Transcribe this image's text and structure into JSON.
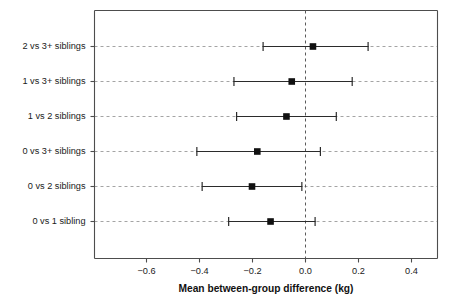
{
  "chart_data": {
    "type": "scatter",
    "subtype": "forest-plot",
    "title": "",
    "xlabel": "Mean between-group difference (kg)",
    "ylabel": "",
    "xlim": [
      -0.78,
      0.5
    ],
    "xticks": [
      -0.6,
      -0.4,
      -0.2,
      0.0,
      0.2,
      0.4
    ],
    "xticklabels": [
      "−0.6",
      "−0.4",
      "−0.2",
      "0.0",
      "0.2",
      "0.4"
    ],
    "grid": "horizontal-dashed",
    "reference_line": 0.0,
    "legend": "none",
    "categories": [
      "2 vs 3+ siblings",
      "1 vs 3+ siblings",
      "1 vs 2 siblings",
      "0 vs 3+ siblings",
      "0 vs 2 siblings",
      "0 vs 1 sibling"
    ],
    "points": [
      {
        "label": "2 vs 3+ siblings",
        "estimate": 0.03,
        "ci_low": -0.16,
        "ci_high": 0.24
      },
      {
        "label": "1 vs 3+ siblings",
        "estimate": -0.05,
        "ci_low": -0.27,
        "ci_high": 0.18
      },
      {
        "label": "1 vs 2 siblings",
        "estimate": -0.07,
        "ci_low": -0.26,
        "ci_high": 0.12
      },
      {
        "label": "0 vs 3+ siblings",
        "estimate": -0.18,
        "ci_low": -0.41,
        "ci_high": 0.06
      },
      {
        "label": "0 vs 2 siblings",
        "estimate": -0.2,
        "ci_low": -0.39,
        "ci_high": -0.01
      },
      {
        "label": "0 vs 1 sibling",
        "estimate": -0.13,
        "ci_low": -0.29,
        "ci_high": 0.04
      }
    ],
    "colors": {
      "marker": "#111111",
      "ci": "#2b2b2b",
      "grid": "#9a9a9a",
      "axis": "#4d4d4d",
      "background": "#ffffff"
    }
  }
}
